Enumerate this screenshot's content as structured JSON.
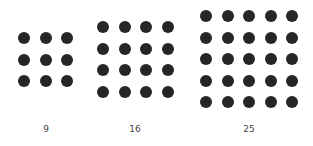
{
  "figure": {
    "dot_color": "#262626",
    "grids": [
      {
        "label": "9",
        "rows": 3,
        "cols": 3,
        "x0": 24,
        "y0": 38,
        "spacing": 21.5,
        "label_x": 46
      },
      {
        "label": "16",
        "rows": 4,
        "cols": 4,
        "x0": 103,
        "y0": 27,
        "spacing": 21.5,
        "label_x": 135
      },
      {
        "label": "25",
        "rows": 5,
        "cols": 5,
        "x0": 206,
        "y0": 16,
        "spacing": 21.5,
        "label_x": 249
      }
    ]
  }
}
